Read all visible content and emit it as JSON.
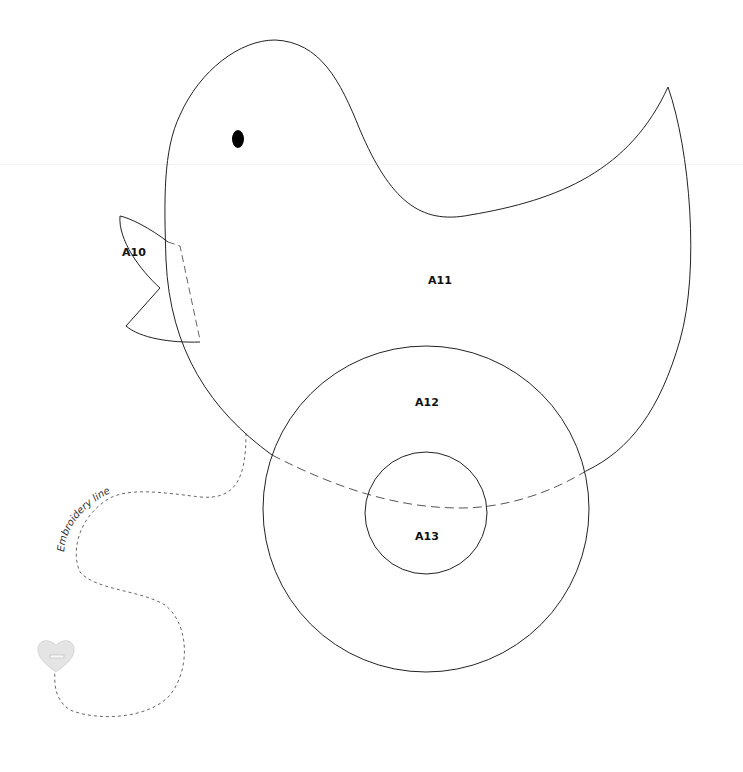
{
  "pattern": {
    "pieces": [
      {
        "id": "A10",
        "label": "A10",
        "part": "beak"
      },
      {
        "id": "A11",
        "label": "A11",
        "part": "body"
      },
      {
        "id": "A12",
        "label": "A12",
        "part": "wheel-outer"
      },
      {
        "id": "A13",
        "label": "A13",
        "part": "wheel-inner"
      }
    ],
    "embroidery": {
      "label": "Embroidery line"
    },
    "colors": {
      "stroke": "#222222",
      "dashed": "#555555",
      "eye": "#000000",
      "heart": "#e2e2e2"
    }
  }
}
